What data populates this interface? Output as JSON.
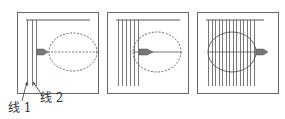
{
  "diagram": {
    "panels": [
      {
        "id": "panel-1",
        "box": {
          "x": 17,
          "y": 12,
          "w": 81,
          "h": 81
        },
        "top_line": {
          "x1": 26,
          "x2": 90,
          "y": 20
        },
        "vertical_lines_x": [
          27,
          32,
          36
        ],
        "lines_y": [
          20,
          86
        ],
        "ellipse": {
          "cx": 73,
          "cy": 52,
          "rx": 24,
          "ry": 19,
          "style": "dashed"
        },
        "axis": {
          "x1": 37,
          "x2": 97,
          "y": 52,
          "style": "dashed"
        },
        "arrow": {
          "x": 37,
          "y": 52,
          "len": 11
        }
      },
      {
        "id": "panel-2",
        "box": {
          "x": 107,
          "y": 12,
          "w": 81,
          "h": 81
        },
        "top_line": {
          "x1": 116,
          "x2": 180,
          "y": 20
        },
        "vertical_lines_x": [
          118,
          122,
          126,
          130,
          134,
          138
        ],
        "lines_y": [
          20,
          86
        ],
        "ellipse": {
          "cx": 157,
          "cy": 52,
          "rx": 24,
          "ry": 20,
          "style": "dashed"
        },
        "axis": {
          "x1": 133,
          "x2": 181,
          "y": 52,
          "style": "solid"
        },
        "arrow": {
          "x": 139,
          "y": 52,
          "len": 14
        }
      },
      {
        "id": "panel-3",
        "box": {
          "x": 197,
          "y": 12,
          "w": 81,
          "h": 81
        },
        "top_line": {
          "x1": 206,
          "x2": 264,
          "y": 20
        },
        "vertical_lines_x": [
          208,
          212,
          215,
          219,
          222,
          226,
          229,
          233,
          236,
          240,
          243,
          247,
          250,
          254
        ],
        "lines_y": [
          20,
          86
        ],
        "ellipse": {
          "cx": 232,
          "cy": 52,
          "rx": 24,
          "ry": 20,
          "style": "solid"
        },
        "axis": {
          "x1": 208,
          "x2": 256,
          "y": 52,
          "style": "solid"
        },
        "arrow": {
          "x": 256,
          "y": 52,
          "len": 12
        }
      }
    ],
    "labels": [
      {
        "text": "线 1",
        "x": 8,
        "y": 98
      },
      {
        "text": "线 2",
        "x": 40,
        "y": 90
      }
    ],
    "pointers": [
      {
        "from": [
          22,
          101
        ],
        "to": [
          27,
          82
        ]
      },
      {
        "from": [
          42,
          95
        ],
        "to": [
          33,
          82
        ]
      }
    ],
    "colors": {
      "stroke": "#555555",
      "arrow_fill": "#777777",
      "box": "#666666"
    }
  }
}
